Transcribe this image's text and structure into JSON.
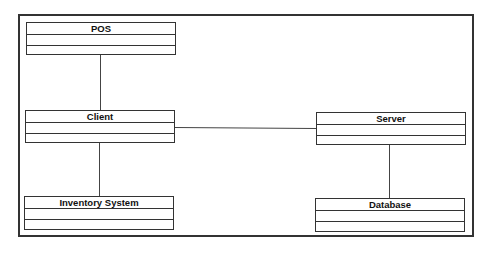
{
  "diagram": {
    "type": "UML class diagram",
    "classes": [
      {
        "name": "POS"
      },
      {
        "name": "Client"
      },
      {
        "name": "Inventory System"
      },
      {
        "name": "Server"
      },
      {
        "name": "Database"
      }
    ],
    "associations": [
      {
        "from": "POS",
        "to": "Client"
      },
      {
        "from": "Client",
        "to": "Inventory System"
      },
      {
        "from": "Client",
        "to": "Server"
      },
      {
        "from": "Server",
        "to": "Database"
      }
    ]
  }
}
